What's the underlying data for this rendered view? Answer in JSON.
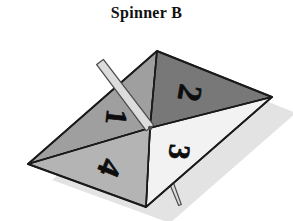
{
  "figure": {
    "title": "Spinner B",
    "kind": "spinner-diagram",
    "background_color": "#ffffff",
    "outline_color": "#1a1a1a",
    "shadow_color": "#e2e2e2"
  },
  "spinner": {
    "name": "Spinner B",
    "sector_count": 4,
    "center": {
      "x": 150,
      "y": 128
    },
    "vertices": {
      "top": {
        "x": 157,
        "y": 51
      },
      "right": {
        "x": 272,
        "y": 97
      },
      "bottom": {
        "x": 146,
        "y": 207
      },
      "left": {
        "x": 28,
        "y": 164
      }
    },
    "sectors": [
      {
        "label": "1",
        "position": "upper-left",
        "fill": "#9f9f9f",
        "text_x": 117,
        "text_y": 117,
        "text_rotation": 96,
        "font_size": 30
      },
      {
        "label": "2",
        "position": "upper-right",
        "fill": "#787878",
        "text_x": 190,
        "text_y": 93,
        "text_rotation": 100,
        "font_size": 33
      },
      {
        "label": "3",
        "position": "lower-right",
        "fill": "#f2f2f2",
        "text_x": 180,
        "text_y": 152,
        "text_rotation": 96,
        "font_size": 30
      },
      {
        "label": "4",
        "position": "lower-left",
        "fill": "#b4b4b4",
        "text_x": 110,
        "text_y": 168,
        "text_rotation": 112,
        "font_size": 32
      }
    ],
    "needle": {
      "pointing_at": "1",
      "fill": "#dcdcdc",
      "outline": "#4d4d4d",
      "tip": {
        "x": 100,
        "y": 62
      },
      "pivot": {
        "x": 150,
        "y": 128
      },
      "tail": {
        "x": 180,
        "y": 205
      }
    }
  }
}
